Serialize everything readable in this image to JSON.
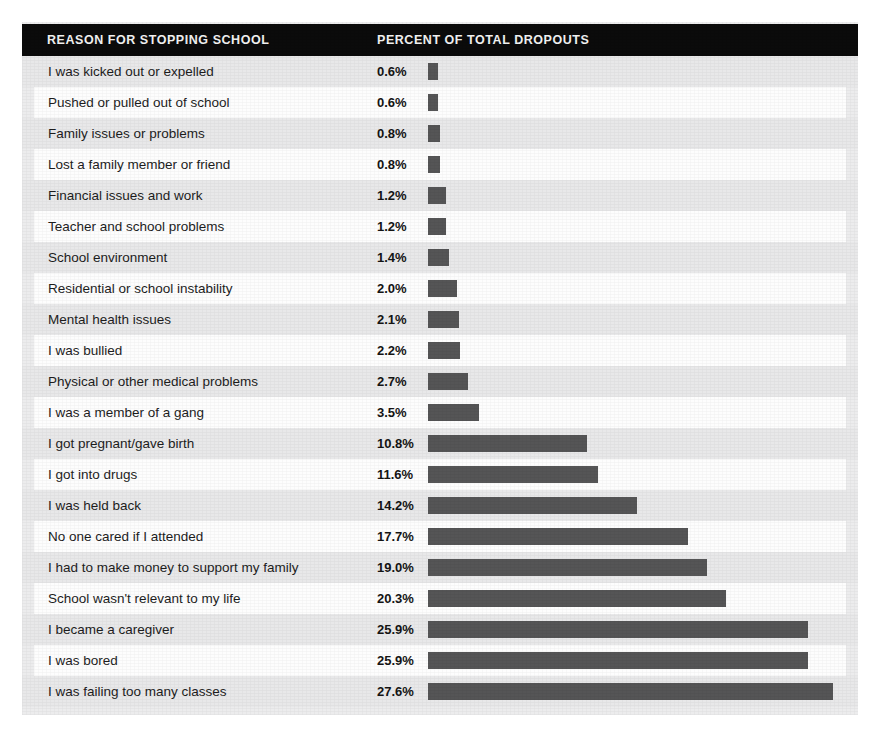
{
  "header": {
    "reason_label": "REASON FOR STOPPING SCHOOL",
    "percent_label": "PERCENT OF TOTAL DROPOUTS"
  },
  "colors": {
    "header_bar": "#0b0b0b",
    "header_text": "#f2f2f2",
    "bar_fill": "#555556",
    "panel_background": "#ececed",
    "row_tint": "#e8e8e9",
    "row_plain": "#fdfdfd",
    "page_background": "#ffffff"
  },
  "chart_data": {
    "type": "bar",
    "orientation": "horizontal",
    "title": "",
    "xlabel": "PERCENT OF TOTAL DROPOUTS",
    "ylabel": "REASON FOR STOPPING SCHOOL",
    "grid": false,
    "legend": null,
    "xlim": [
      0,
      27.6
    ],
    "value_suffix": "%",
    "sorted": "ascending",
    "px_per_percent": 14.68,
    "categories": [
      "I was kicked out or expelled",
      "Pushed or pulled out of school",
      "Family issues or problems",
      "Lost a family member or friend",
      "Financial issues and work",
      "Teacher and school problems",
      "School environment",
      "Residential or school instability",
      "Mental health issues",
      "I was bullied",
      "Physical or other medical problems",
      "I was a member of a gang",
      "I got pregnant/gave birth",
      "I got into drugs",
      "I was held back",
      "No one cared if I attended",
      "I had to make money to support my family",
      "School wasn't relevant to my life",
      "I became a caregiver",
      "I was bored",
      "I was failing too many classes"
    ],
    "values": [
      0.6,
      0.6,
      0.8,
      0.8,
      1.2,
      1.2,
      1.4,
      2.0,
      2.1,
      2.2,
      2.7,
      3.5,
      10.8,
      11.6,
      14.2,
      17.7,
      19.0,
      20.3,
      25.9,
      25.9,
      27.6
    ],
    "value_labels": [
      "0.6%",
      "0.6%",
      "0.8%",
      "0.8%",
      "1.2%",
      "1.2%",
      "1.4%",
      "2.0%",
      "2.1%",
      "2.2%",
      "2.7%",
      "3.5%",
      "10.8%",
      "11.6%",
      "14.2%",
      "17.7%",
      "19.0%",
      "20.3%",
      "25.9%",
      "25.9%",
      "27.6%"
    ]
  }
}
